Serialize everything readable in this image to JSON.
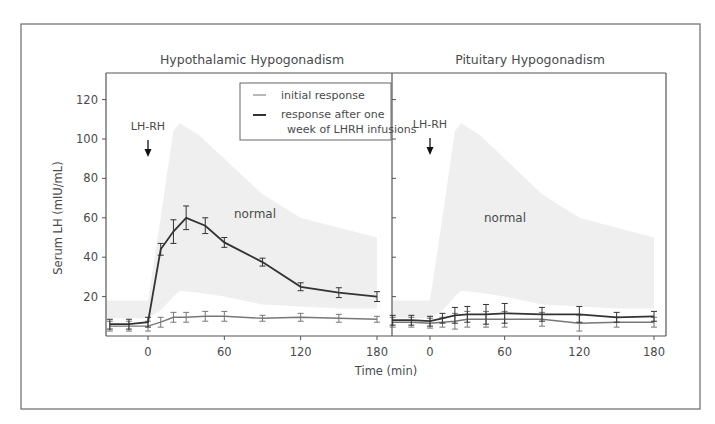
{
  "chart_data": [
    {
      "type": "line",
      "title": "Hypothalamic Hypogonadism",
      "xlabel": "Time (min)",
      "ylabel": "Serum LH (mIU/mL)",
      "xticks": [
        0,
        60,
        120,
        180
      ],
      "yticks": [
        20,
        40,
        60,
        80,
        100,
        120
      ],
      "xlim": [
        -33,
        192
      ],
      "ylim": [
        0,
        133
      ],
      "annotation": "LH-RH",
      "annotation_x": 0,
      "band_label": "normal",
      "normal_band": {
        "x": [
          -33,
          0,
          10,
          20,
          25,
          40,
          60,
          90,
          120,
          150,
          180
        ],
        "upper": [
          18,
          18,
          60,
          104,
          108,
          102,
          90,
          72,
          60,
          55,
          50
        ],
        "lower": [
          9,
          9,
          13,
          20,
          23,
          22,
          20,
          16,
          15,
          14,
          14
        ]
      },
      "x": [
        -30,
        -15,
        0,
        10,
        20,
        30,
        45,
        60,
        90,
        120,
        150,
        180
      ],
      "series": [
        {
          "name": "initial response",
          "values": [
            5,
            5,
            5,
            7,
            9.5,
            9.5,
            10,
            10,
            9,
            9.5,
            9,
            8.5
          ],
          "err": [
            2.5,
            2.5,
            2.5,
            2.5,
            2.5,
            2.5,
            2.5,
            2.5,
            1.5,
            2,
            2,
            1.5
          ],
          "color": "#777777"
        },
        {
          "name": "response after one week of LHRH infusions",
          "values": [
            6,
            6,
            7,
            44,
            53,
            60,
            56,
            47.5,
            37.5,
            25,
            22,
            20
          ],
          "err": [
            2.5,
            2.5,
            2.5,
            3,
            6,
            6,
            4,
            2.5,
            2,
            2,
            2.5,
            2.5
          ],
          "color": "#333333"
        }
      ]
    },
    {
      "type": "line",
      "title": "Pituitary Hypogonadism",
      "xlabel": "Time (min)",
      "xticks": [
        0,
        60,
        120,
        180
      ],
      "xlim": [
        -30,
        192
      ],
      "ylim": [
        0,
        133
      ],
      "annotation": "LH-RH",
      "annotation_x": 0,
      "band_label": "normal",
      "normal_band": {
        "x": [
          -30,
          0,
          10,
          20,
          25,
          40,
          60,
          90,
          120,
          150,
          180
        ],
        "upper": [
          18,
          18,
          60,
          104,
          108,
          102,
          90,
          72,
          60,
          55,
          50
        ],
        "lower": [
          9,
          9,
          13,
          20,
          23,
          22,
          20,
          16,
          15,
          14,
          14
        ]
      },
      "x": [
        -30,
        -15,
        0,
        10,
        20,
        30,
        45,
        60,
        90,
        120,
        150,
        180
      ],
      "series": [
        {
          "name": "initial response",
          "values": [
            7,
            7,
            6.5,
            7,
            7.5,
            8.5,
            8.5,
            8.5,
            8.5,
            6.5,
            7,
            7
          ],
          "err": [
            2.5,
            2.5,
            2.5,
            2.5,
            4,
            4,
            4,
            4,
            3.5,
            4,
            2.5,
            2.5
          ],
          "color": "#777777"
        },
        {
          "name": "response after one week of LHRH infusions",
          "values": [
            8,
            8,
            7.5,
            9,
            10.5,
            11,
            11,
            11.5,
            11,
            11,
            9.5,
            10
          ],
          "err": [
            2.5,
            2.5,
            2.5,
            2.5,
            4,
            4,
            5,
            5,
            3.5,
            4,
            2.5,
            2.5
          ],
          "color": "#333333"
        }
      ]
    }
  ],
  "legend": {
    "items": [
      "initial response",
      "response after one",
      "week of LHRH infusions"
    ]
  },
  "labels": {
    "left_title": "Hypothalamic Hypogonadism",
    "right_title": "Pituitary Hypogonadism",
    "ylabel": "Serum LH (mIU/mL)",
    "xlabel": "Time (min)",
    "arrow_label": "LH-RH",
    "normal": "normal"
  },
  "colors": {
    "band": "#efefef",
    "axis": "#555555",
    "text": "#4a4a4a",
    "initial": "#777777",
    "after": "#333333"
  }
}
